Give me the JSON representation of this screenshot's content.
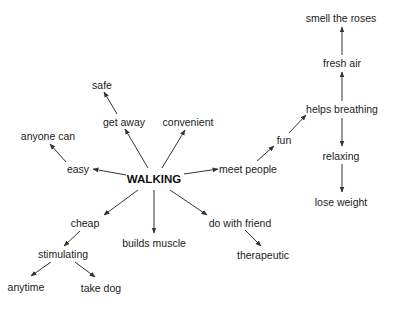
{
  "diagram": {
    "type": "mind-map",
    "root": {
      "id": "walking",
      "label": "WALKING",
      "x": 154,
      "y": 180
    },
    "nodes": [
      {
        "id": "easy",
        "label": "easy",
        "x": 78,
        "y": 169
      },
      {
        "id": "anyone-can",
        "label": "anyone can",
        "x": 48,
        "y": 136
      },
      {
        "id": "get-away",
        "label": "get away",
        "x": 124,
        "y": 122
      },
      {
        "id": "safe",
        "label": "safe",
        "x": 102,
        "y": 85
      },
      {
        "id": "convenient",
        "label": "convenient",
        "x": 188,
        "y": 122
      },
      {
        "id": "meet-people",
        "label": "meet people",
        "x": 248,
        "y": 169
      },
      {
        "id": "fun",
        "label": "fun",
        "x": 284,
        "y": 140
      },
      {
        "id": "helps-breathing",
        "label": "helps breathing",
        "x": 342,
        "y": 109
      },
      {
        "id": "fresh-air",
        "label": "fresh air",
        "x": 342,
        "y": 63
      },
      {
        "id": "smell-the-roses",
        "label": "smell the roses",
        "x": 341,
        "y": 18
      },
      {
        "id": "relaxing",
        "label": "relaxing",
        "x": 341,
        "y": 156
      },
      {
        "id": "lose-weight",
        "label": "lose weight",
        "x": 341,
        "y": 202
      },
      {
        "id": "cheap",
        "label": "cheap",
        "x": 85,
        "y": 223
      },
      {
        "id": "stimulating",
        "label": "stimulating",
        "x": 63,
        "y": 254
      },
      {
        "id": "anytime",
        "label": "anytime",
        "x": 26,
        "y": 287
      },
      {
        "id": "take-dog",
        "label": "take dog",
        "x": 101,
        "y": 288
      },
      {
        "id": "builds-muscle",
        "label": "builds muscle",
        "x": 154,
        "y": 243
      },
      {
        "id": "do-with-friend",
        "label": "do with friend",
        "x": 240,
        "y": 223
      },
      {
        "id": "therapeutic",
        "label": "therapeutic",
        "x": 263,
        "y": 255
      }
    ],
    "edges": [
      {
        "from": "walking",
        "to": "easy",
        "x1": 126,
        "y1": 175,
        "x2": 93,
        "y2": 169
      },
      {
        "from": "easy",
        "to": "anyone-can",
        "x1": 66,
        "y1": 162,
        "x2": 50,
        "y2": 144
      },
      {
        "from": "walking",
        "to": "get-away",
        "x1": 148,
        "y1": 168,
        "x2": 125,
        "y2": 129
      },
      {
        "from": "get-away",
        "to": "safe",
        "x1": 117,
        "y1": 114,
        "x2": 104,
        "y2": 92
      },
      {
        "from": "walking",
        "to": "convenient",
        "x1": 162,
        "y1": 168,
        "x2": 185,
        "y2": 130
      },
      {
        "from": "walking",
        "to": "meet-people",
        "x1": 184,
        "y1": 174,
        "x2": 218,
        "y2": 169
      },
      {
        "from": "meet-people",
        "to": "fun",
        "x1": 257,
        "y1": 161,
        "x2": 274,
        "y2": 146
      },
      {
        "from": "fun",
        "to": "helps-breathing",
        "x1": 289,
        "y1": 133,
        "x2": 306,
        "y2": 115
      },
      {
        "from": "helps-breathing",
        "to": "fresh-air",
        "x1": 342,
        "y1": 101,
        "x2": 342,
        "y2": 72
      },
      {
        "from": "fresh-air",
        "to": "smell-the-roses",
        "x1": 342,
        "y1": 55,
        "x2": 342,
        "y2": 27
      },
      {
        "from": "helps-breathing",
        "to": "relaxing",
        "x1": 342,
        "y1": 118,
        "x2": 342,
        "y2": 146
      },
      {
        "from": "relaxing",
        "to": "lose-weight",
        "x1": 342,
        "y1": 164,
        "x2": 342,
        "y2": 192
      },
      {
        "from": "walking",
        "to": "cheap",
        "x1": 138,
        "y1": 190,
        "x2": 104,
        "y2": 215
      },
      {
        "from": "cheap",
        "to": "stimulating",
        "x1": 80,
        "y1": 231,
        "x2": 64,
        "y2": 246
      },
      {
        "from": "stimulating",
        "to": "anytime",
        "x1": 51,
        "y1": 262,
        "x2": 31,
        "y2": 276
      },
      {
        "from": "stimulating",
        "to": "take-dog",
        "x1": 75,
        "y1": 262,
        "x2": 95,
        "y2": 277
      },
      {
        "from": "walking",
        "to": "builds-muscle",
        "x1": 154,
        "y1": 190,
        "x2": 154,
        "y2": 233
      },
      {
        "from": "walking",
        "to": "do-with-friend",
        "x1": 170,
        "y1": 190,
        "x2": 207,
        "y2": 215
      },
      {
        "from": "do-with-friend",
        "to": "therapeutic",
        "x1": 245,
        "y1": 230,
        "x2": 261,
        "y2": 246
      }
    ],
    "colors": {
      "line": "#333333",
      "text": "#222222",
      "background": "#ffffff"
    }
  }
}
